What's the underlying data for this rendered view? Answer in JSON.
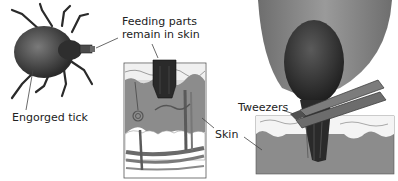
{
  "labels": {
    "engorged_tick": "Engorged tick",
    "feeding_parts_line1": "Feeding parts",
    "feeding_parts_line2": "remain in skin",
    "skin": "Skin",
    "tweezers": "Tweezers"
  },
  "colors": {
    "tick_body": "#3a3a3a",
    "skin_dermis": "#8a8a8a",
    "skin_epidermis": "#f2f2f2",
    "fat_layer": "#ffffff",
    "tweezers": "#6a6a6a",
    "background": "#ffffff"
  }
}
